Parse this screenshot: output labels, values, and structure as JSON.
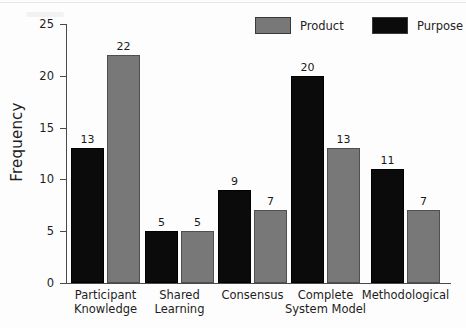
{
  "chart_data": {
    "type": "bar",
    "title": "",
    "xlabel": "",
    "ylabel": "Frequency",
    "ylim": [
      0,
      25
    ],
    "yticks": [
      0,
      5,
      10,
      15,
      20,
      25
    ],
    "grid": false,
    "legend_position": "top-right",
    "categories": [
      "Participant\nKnowledge",
      "Shared\nLearning",
      "Consensus",
      "Complete\nSystem Model",
      "Methodological"
    ],
    "series": [
      {
        "name": "Purpose",
        "color": "#0b0b0b",
        "values": [
          13,
          5,
          9,
          20,
          11
        ]
      },
      {
        "name": "Product",
        "color": "#787878",
        "values": [
          22,
          5,
          7,
          13,
          7
        ]
      }
    ]
  },
  "legend": {
    "entries": [
      {
        "label": "Product",
        "color": "#787878"
      },
      {
        "label": "Purpose",
        "color": "#0b0b0b"
      }
    ]
  },
  "axis": {
    "y_title": "Frequency",
    "y_ticks": [
      "0",
      "5",
      "10",
      "15",
      "20",
      "25"
    ]
  }
}
